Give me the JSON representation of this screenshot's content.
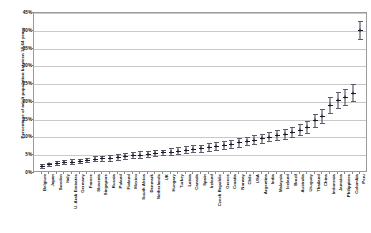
{
  "chart_data": {
    "type": "scatter",
    "title": "",
    "xlabel": "",
    "ylabel": "Percentage of adult population between 18-64 years",
    "ylim": [
      0,
      45
    ],
    "ytick_labels": [
      "0%",
      "5%",
      "10%",
      "15%",
      "20%",
      "25%",
      "30%",
      "35%",
      "40%",
      "45%"
    ],
    "ytick_values": [
      0,
      5,
      10,
      15,
      20,
      25,
      30,
      35,
      40,
      45
    ],
    "grid": true,
    "legend": "none",
    "error_bars": true,
    "categories": [
      "Belgium",
      "Japan",
      "Sweden",
      "Italy",
      "U. Arab Emirates",
      "Germany",
      "France",
      "Slovenia",
      "Singapore",
      "Russia",
      "Poland",
      "Finland",
      "Mexico",
      "South Africa",
      "Denmark",
      "Netherlands",
      "UK",
      "Hungary",
      "Turkey",
      "Latvia",
      "Canada",
      "Spain",
      "Ireland",
      "Czech Republic",
      "Greece",
      "Croatia",
      "Norway",
      "Chile",
      "USA",
      "Argentina",
      "India",
      "Malaysia",
      "Iceland",
      "Brazil",
      "Australia",
      "Uruguay",
      "Thailand",
      "China",
      "Indonesia",
      "Jamaica",
      "Philippines",
      "Colombia",
      "Peru"
    ],
    "values": [
      2.0,
      2.4,
      2.8,
      3.0,
      3.2,
      3.4,
      3.6,
      4.0,
      4.1,
      4.3,
      4.5,
      4.8,
      5.0,
      5.2,
      5.4,
      5.6,
      5.8,
      6.0,
      6.3,
      6.6,
      6.8,
      7.0,
      7.3,
      7.6,
      7.9,
      8.2,
      8.6,
      9.0,
      9.4,
      9.8,
      10.2,
      10.6,
      11.0,
      11.5,
      12.2,
      13.0,
      14.8,
      16.0,
      19.2,
      20.5,
      21.3,
      22.6,
      40.2
    ],
    "errors": [
      0.5,
      0.5,
      0.6,
      0.6,
      0.7,
      0.6,
      0.6,
      0.7,
      0.7,
      0.8,
      0.8,
      0.8,
      0.9,
      0.9,
      0.9,
      0.9,
      0.8,
      1.0,
      1.0,
      1.1,
      1.0,
      1.0,
      1.1,
      1.1,
      1.1,
      1.2,
      1.2,
      1.2,
      1.2,
      1.3,
      1.3,
      1.4,
      1.4,
      1.5,
      1.6,
      1.7,
      1.9,
      2.0,
      2.2,
      2.2,
      2.3,
      2.4,
      2.6
    ]
  },
  "colors": {
    "marker": "#1a1a28",
    "whisker": "#3a3a4a",
    "gridline": "#c9c9c9",
    "frame": "#9a9a9a",
    "background": "#ffffff"
  }
}
